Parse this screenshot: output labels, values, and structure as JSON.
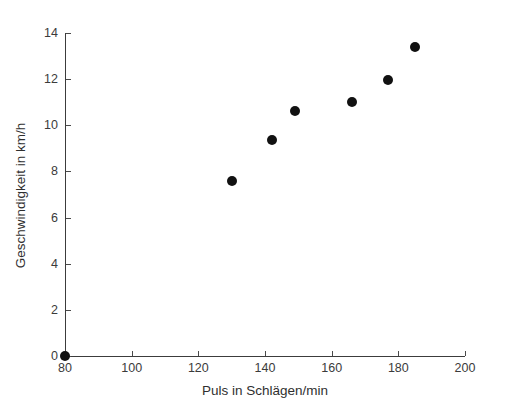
{
  "chart_data": {
    "type": "scatter",
    "title": "",
    "xlabel": "Puls in Schlägen/min",
    "ylabel": "Geschwindigkeit in km/h",
    "xlim": [
      80,
      200
    ],
    "ylim": [
      0,
      14
    ],
    "xticks": [
      80,
      100,
      120,
      140,
      160,
      180,
      200
    ],
    "yticks": [
      0,
      2,
      4,
      6,
      8,
      10,
      12,
      14
    ],
    "xtick_labels": [
      "80",
      "100",
      "120",
      "140",
      "160",
      "180",
      "200"
    ],
    "ytick_labels": [
      "0",
      "2",
      "4",
      "6",
      "8",
      "10",
      "12",
      "14"
    ],
    "grid": false,
    "legend": null,
    "marker": {
      "shape": "circle",
      "color": "#111111",
      "size_px": 10
    },
    "series": [
      {
        "name": "Messpunkte",
        "x": [
          80,
          130,
          142,
          149,
          166,
          177,
          185
        ],
        "y": [
          0,
          7.6,
          9.35,
          10.6,
          11.0,
          11.95,
          13.4
        ]
      }
    ]
  },
  "axes": {
    "x_title": "Puls in Schlägen/min",
    "y_title": "Geschwindigkeit in km/h",
    "axis_color": "#3c3c3c"
  }
}
